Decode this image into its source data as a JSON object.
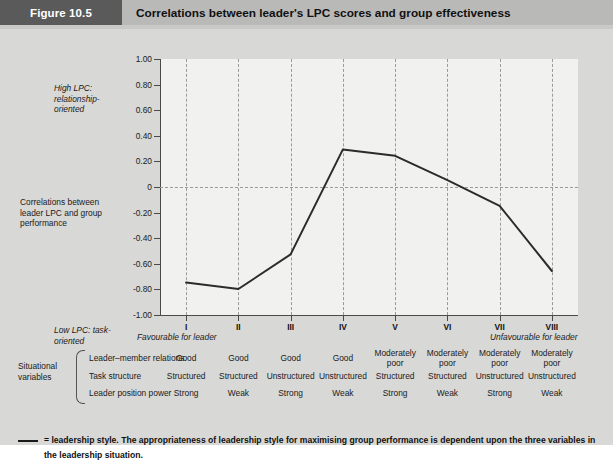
{
  "header": {
    "figure_number": "Figure 10.5",
    "title": "Correlations between leader's LPC scores and group effectiveness"
  },
  "axis_notes": {
    "high_lpc": "High LPC: relationship-oriented",
    "y_axis_label": "Correlations between leader LPC and group performance",
    "low_lpc": "Low LPC: task-oriented",
    "favourable": "Favourable for leader",
    "unfavourable": "Unfavourable for leader"
  },
  "variables": {
    "group_label": "Situational variables",
    "rows": [
      {
        "label": "Leader–member relations",
        "values": [
          "Good",
          "Good",
          "Good",
          "Good",
          "Moderately poor",
          "Moderately poor",
          "Moderately poor",
          "Moderately poor"
        ]
      },
      {
        "label": "Task structure",
        "values": [
          "Structured",
          "Structured",
          "Unstructured",
          "Unstructured",
          "Structured",
          "Structured",
          "Unstructured",
          "Unstructured"
        ]
      },
      {
        "label": "Leader position power",
        "values": [
          "Strong",
          "Weak",
          "Strong",
          "Weak",
          "Strong",
          "Weak",
          "Strong",
          "Weak"
        ]
      }
    ]
  },
  "footnote": {
    "legend_symbol": "—",
    "text": "= leadership style.   The appropriateness of leadership style for maximising group performance is dependent upon the three variables in the leadership situation."
  },
  "colors": {
    "badge_background": "#5a5a5a",
    "title_strip_background": "#b9b9b7",
    "page_background": "#d8d8d6",
    "plot_background": "#f1f1ef",
    "series_line": "#2b2b2b",
    "grid_dashed": "#9a9a98",
    "axis": "#4a4a4a"
  },
  "chart_data": {
    "type": "line",
    "title": "Correlations between leader's LPC scores and group effectiveness",
    "xlabel": "",
    "ylabel": "Correlations between leader LPC and group performance",
    "categories": [
      "I",
      "II",
      "III",
      "IV",
      "V",
      "VI",
      "VII",
      "VIII"
    ],
    "values": [
      -0.52,
      -0.57,
      -0.3,
      0.52,
      0.47,
      0.28,
      0.08,
      -0.43
    ],
    "series": [
      {
        "name": "leadership style",
        "values": [
          -0.52,
          -0.57,
          -0.3,
          0.52,
          0.47,
          0.28,
          0.08,
          -0.43
        ]
      }
    ],
    "ylim": [
      -1.0,
      1.0
    ],
    "yticks": [
      1.0,
      0.8,
      0.6,
      0.4,
      0.2,
      0,
      -0.2,
      -0.4,
      -0.6,
      -0.8,
      -1.0
    ],
    "ytick_labels": [
      "1.00",
      "0.80",
      "0.60",
      "0.40",
      "0.20",
      "0",
      "-0.20",
      "-0.40",
      "-0.60",
      "-0.80",
      "-1.00"
    ],
    "grid": "dashed-vertical-per-category-plus-zero-line",
    "legend": "below-plot",
    "annotations": [
      "High LPC: relationship-oriented",
      "Low LPC: task-oriented",
      "Favourable for leader",
      "Unfavourable for leader"
    ]
  }
}
